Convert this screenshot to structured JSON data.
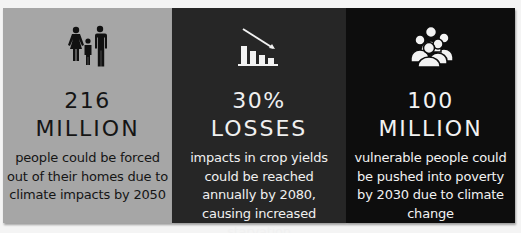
{
  "colors": {
    "page_background": "#f4f4f4",
    "panel1_background": "#a6a6a6",
    "panel2_background": "#262626",
    "panel3_background": "#0d0d0d"
  },
  "panels": [
    {
      "icon": "family-icon",
      "number": "216",
      "unit": "MILLION",
      "description": "people could be forced out of their homes due to climate impacts by 2050"
    },
    {
      "icon": "declining-bar-chart-icon",
      "number": "30%",
      "unit": "LOSSES",
      "description": "impacts in crop yields could be reached annually by 2080, causing increased starvation"
    },
    {
      "icon": "group-of-people-icon",
      "number": "100",
      "unit": "MILLION",
      "description": "vulnerable people could be pushed into poverty by 2030 due to climate change"
    }
  ]
}
